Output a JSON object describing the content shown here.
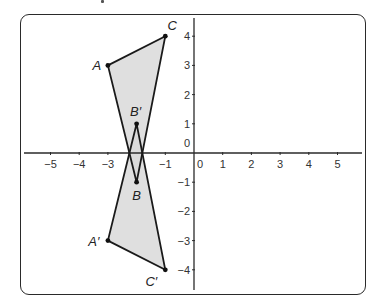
{
  "diagram": {
    "type": "coordinate-plane-reflection",
    "colors": {
      "axis": "#2a2a2a",
      "shape_fill": "#d9d9d9",
      "shape_stroke": "#1a1a1a",
      "frame": "#2a2a2a"
    },
    "axes": {
      "x_range": [
        -5,
        5
      ],
      "y_range": [
        -4,
        4
      ],
      "origin_label": "0",
      "x_ticks": [
        "−5",
        "−4",
        "−3",
        "−1",
        "0",
        "1",
        "2",
        "3",
        "4",
        "5"
      ],
      "y_ticks": [
        "4",
        "3",
        "2",
        "1",
        "0",
        "−1",
        "−2",
        "−3",
        "−4"
      ]
    },
    "triangles": [
      {
        "name": "ABC",
        "points": [
          {
            "label": "A",
            "x": -3,
            "y": 3
          },
          {
            "label": "B",
            "x": -2,
            "y": -1
          },
          {
            "label": "C",
            "x": -1,
            "y": 4
          }
        ]
      },
      {
        "name": "A'B'C'",
        "points": [
          {
            "label": "A′",
            "x": -3,
            "y": -3
          },
          {
            "label": "B′",
            "x": -2,
            "y": 1
          },
          {
            "label": "C′",
            "x": -1,
            "y": -4
          }
        ]
      }
    ]
  }
}
